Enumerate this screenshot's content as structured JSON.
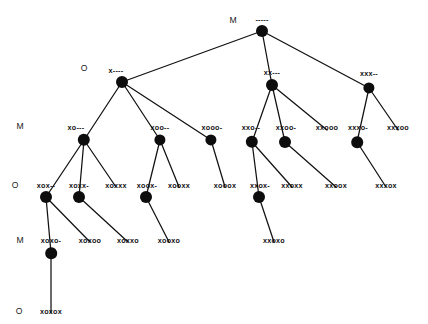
{
  "figure": {
    "width": 428,
    "height": 324,
    "background_color": "#ffffff",
    "node_color": "#0d0d0d",
    "edge_color": "#111111",
    "text_color": "#111111"
  },
  "player_row_labels": [
    {
      "id": "row-0",
      "text": "M",
      "x": 233,
      "y": 20
    },
    {
      "id": "row-1",
      "text": "O",
      "x": 84,
      "y": 68
    },
    {
      "id": "row-2",
      "text": "M",
      "x": 20,
      "y": 126
    },
    {
      "id": "row-3",
      "text": "O",
      "x": 15,
      "y": 185
    },
    {
      "id": "row-4",
      "text": "M",
      "x": 20,
      "y": 240
    },
    {
      "id": "row-5",
      "text": "O",
      "x": 19,
      "y": 311
    }
  ],
  "nodes": [
    {
      "id": "n0",
      "label": "-----",
      "x": 262,
      "y": 31,
      "label_x": 262,
      "label_y": 19,
      "dot": true,
      "radius": 6.0,
      "depth": 0
    },
    {
      "id": "n1",
      "label": "x----",
      "x": 122,
      "y": 82,
      "label_x": 116,
      "label_y": 70,
      "dot": true,
      "radius": 6.0,
      "depth": 1
    },
    {
      "id": "n2",
      "label": "xx---",
      "x": 272,
      "y": 85,
      "label_x": 272,
      "label_y": 72,
      "dot": true,
      "radius": 6.0,
      "depth": 1
    },
    {
      "id": "n3",
      "label": "xxx--",
      "x": 369,
      "y": 88,
      "label_x": 369,
      "label_y": 73,
      "dot": true,
      "radius": 5.6,
      "depth": 1
    },
    {
      "id": "n4",
      "label": "xo---",
      "x": 84,
      "y": 140,
      "label_x": 76,
      "label_y": 127,
      "dot": true,
      "radius": 6.2,
      "depth": 2
    },
    {
      "id": "n5",
      "label": "xoo--",
      "x": 160,
      "y": 140,
      "label_x": 160,
      "label_y": 127,
      "dot": true,
      "radius": 5.6,
      "depth": 2
    },
    {
      "id": "n6",
      "label": "xooo-",
      "x": 211,
      "y": 140,
      "label_x": 212,
      "label_y": 127,
      "dot": true,
      "radius": 5.6,
      "depth": 2
    },
    {
      "id": "n7",
      "label": "xxo--",
      "x": 252,
      "y": 142,
      "label_x": 251,
      "label_y": 127,
      "dot": true,
      "radius": 6.2,
      "depth": 2
    },
    {
      "id": "n8",
      "label": "xxoo-",
      "x": 285,
      "y": 142,
      "label_x": 286,
      "label_y": 127,
      "dot": true,
      "radius": 6.0,
      "depth": 2
    },
    {
      "id": "n9",
      "label": "xxooo",
      "x": 327,
      "y": 130,
      "label_x": 327,
      "label_y": 127,
      "dot": false,
      "radius": 0,
      "depth": 2
    },
    {
      "id": "n10",
      "label": "xxxo-",
      "x": 357,
      "y": 142,
      "label_x": 358,
      "label_y": 127,
      "dot": true,
      "radius": 5.8,
      "depth": 2
    },
    {
      "id": "n11",
      "label": "xxxoo",
      "x": 398,
      "y": 130,
      "label_x": 398,
      "label_y": 127,
      "dot": false,
      "radius": 0,
      "depth": 2
    },
    {
      "id": "n12",
      "label": "xox--",
      "x": 46,
      "y": 197,
      "label_x": 46,
      "label_y": 185,
      "dot": true,
      "radius": 6.0,
      "depth": 3
    },
    {
      "id": "n13",
      "label": "xoxx-",
      "x": 79,
      "y": 197,
      "label_x": 79,
      "label_y": 185,
      "dot": true,
      "radius": 6.0,
      "depth": 3
    },
    {
      "id": "n14",
      "label": "xoxxx",
      "x": 116,
      "y": 187,
      "label_x": 116,
      "label_y": 185,
      "dot": false,
      "radius": 0,
      "depth": 3
    },
    {
      "id": "n15",
      "label": "xoox-",
      "x": 146,
      "y": 197,
      "label_x": 147,
      "label_y": 185,
      "dot": true,
      "radius": 6.0,
      "depth": 3
    },
    {
      "id": "n16",
      "label": "xooxx",
      "x": 179,
      "y": 187,
      "label_x": 179,
      "label_y": 185,
      "dot": false,
      "radius": 0,
      "depth": 3
    },
    {
      "id": "n17",
      "label": "xooox",
      "x": 225,
      "y": 187,
      "label_x": 225,
      "label_y": 185,
      "dot": false,
      "radius": 0,
      "depth": 3
    },
    {
      "id": "n18",
      "label": "xxox-",
      "x": 259,
      "y": 197,
      "label_x": 260,
      "label_y": 185,
      "dot": true,
      "radius": 6.0,
      "depth": 3
    },
    {
      "id": "n19",
      "label": "xxoxx",
      "x": 292,
      "y": 187,
      "label_x": 292,
      "label_y": 185,
      "dot": false,
      "radius": 0,
      "depth": 3
    },
    {
      "id": "n20",
      "label": "xxoox",
      "x": 336,
      "y": 187,
      "label_x": 336,
      "label_y": 185,
      "dot": false,
      "radius": 0,
      "depth": 3
    },
    {
      "id": "n21",
      "label": "xxxox",
      "x": 386,
      "y": 187,
      "label_x": 386,
      "label_y": 185,
      "dot": false,
      "radius": 0,
      "depth": 3
    },
    {
      "id": "n22",
      "label": "xoxo-",
      "x": 51,
      "y": 253,
      "label_x": 51,
      "label_y": 240,
      "dot": true,
      "radius": 5.8,
      "depth": 4
    },
    {
      "id": "n23",
      "label": "xoxoo",
      "x": 90,
      "y": 242,
      "label_x": 90,
      "label_y": 240,
      "dot": false,
      "radius": 0,
      "depth": 4
    },
    {
      "id": "n24",
      "label": "xoxxo",
      "x": 128,
      "y": 242,
      "label_x": 128,
      "label_y": 240,
      "dot": false,
      "radius": 0,
      "depth": 4
    },
    {
      "id": "n25",
      "label": "xooxo",
      "x": 169,
      "y": 242,
      "label_x": 169,
      "label_y": 240,
      "dot": false,
      "radius": 0,
      "depth": 4
    },
    {
      "id": "n26",
      "label": "xxoxo",
      "x": 274,
      "y": 242,
      "label_x": 274,
      "label_y": 240,
      "dot": false,
      "radius": 0,
      "depth": 4
    },
    {
      "id": "n27",
      "label": "xoxox",
      "x": 51,
      "y": 313,
      "label_x": 51,
      "label_y": 311,
      "dot": false,
      "radius": 0,
      "depth": 5
    }
  ],
  "edges": [
    {
      "from": "n0",
      "to": "n1"
    },
    {
      "from": "n0",
      "to": "n2"
    },
    {
      "from": "n0",
      "to": "n3"
    },
    {
      "from": "n1",
      "to": "n4"
    },
    {
      "from": "n1",
      "to": "n5"
    },
    {
      "from": "n1",
      "to": "n6"
    },
    {
      "from": "n2",
      "to": "n7"
    },
    {
      "from": "n2",
      "to": "n8"
    },
    {
      "from": "n2",
      "to": "n9"
    },
    {
      "from": "n3",
      "to": "n10"
    },
    {
      "from": "n3",
      "to": "n11"
    },
    {
      "from": "n4",
      "to": "n12"
    },
    {
      "from": "n4",
      "to": "n13"
    },
    {
      "from": "n4",
      "to": "n14"
    },
    {
      "from": "n5",
      "to": "n15"
    },
    {
      "from": "n5",
      "to": "n16"
    },
    {
      "from": "n6",
      "to": "n17"
    },
    {
      "from": "n7",
      "to": "n18"
    },
    {
      "from": "n7",
      "to": "n19"
    },
    {
      "from": "n8",
      "to": "n20"
    },
    {
      "from": "n10",
      "to": "n21"
    },
    {
      "from": "n12",
      "to": "n22"
    },
    {
      "from": "n12",
      "to": "n23"
    },
    {
      "from": "n13",
      "to": "n24"
    },
    {
      "from": "n15",
      "to": "n25"
    },
    {
      "from": "n18",
      "to": "n26"
    },
    {
      "from": "n22",
      "to": "n27"
    }
  ]
}
